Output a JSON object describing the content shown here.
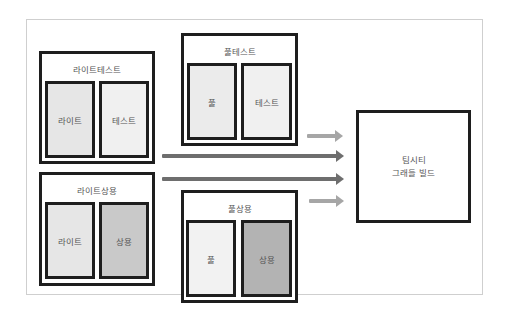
{
  "diagram": {
    "groups": [
      {
        "id": "lite-test",
        "title": "라이트테스트",
        "cells": [
          {
            "label": "라이트",
            "fill": "#e6e6e6"
          },
          {
            "label": "테스트",
            "fill": "#f0f0f0"
          }
        ]
      },
      {
        "id": "lite-commercial",
        "title": "라이트상용",
        "cells": [
          {
            "label": "라이트",
            "fill": "#e6e6e6"
          },
          {
            "label": "상용",
            "fill": "#c9c9c9"
          }
        ]
      },
      {
        "id": "full-test",
        "title": "풀테스트",
        "cells": [
          {
            "label": "풀",
            "fill": "#ebebeb"
          },
          {
            "label": "테스트",
            "fill": "#f0f0f0"
          }
        ]
      },
      {
        "id": "full-commercial",
        "title": "풀상용",
        "cells": [
          {
            "label": "풀",
            "fill": "#f2f2f2"
          },
          {
            "label": "상용",
            "fill": "#b3b3b3"
          }
        ]
      }
    ],
    "target": {
      "line1": "팀시티",
      "line2": "그래들 빌드"
    },
    "arrows": [
      {
        "from": "full-test",
        "to": "target",
        "color": "#a6a6a6"
      },
      {
        "from": "lite-test",
        "to": "target",
        "color": "#6e6e6e"
      },
      {
        "from": "lite-commercial",
        "to": "target",
        "color": "#6e6e6e"
      },
      {
        "from": "full-commercial",
        "to": "target",
        "color": "#a6a6a6"
      }
    ]
  }
}
